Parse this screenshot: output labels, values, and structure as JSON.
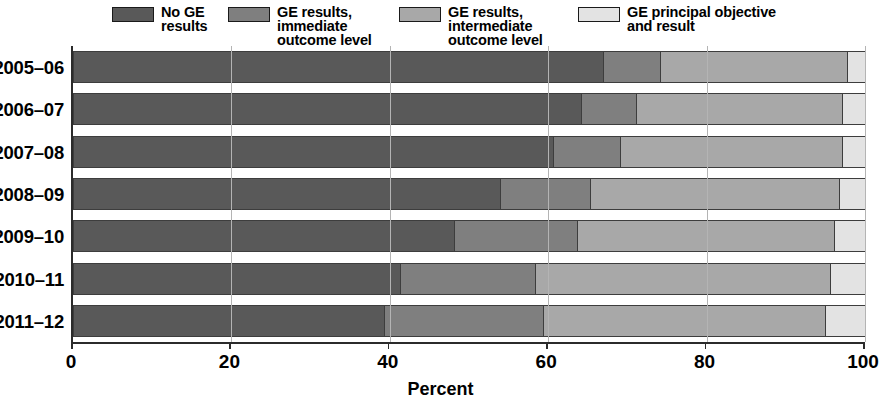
{
  "chart_data": {
    "type": "bar",
    "orientation": "horizontal",
    "stacked": true,
    "stack_mode": "percent",
    "title": "",
    "xlabel": "Percent",
    "ylabel": "",
    "xlim": [
      0,
      100
    ],
    "xticks": [
      0,
      20,
      40,
      60,
      80,
      100
    ],
    "xtick_labels": [
      "0",
      "20",
      "40",
      "60",
      "80",
      "100"
    ],
    "grid": true,
    "grid_axis": "x",
    "legend_position": "top",
    "categories": [
      "2005–06",
      "2006–07",
      "2007–08",
      "2008–09",
      "2009–10",
      "2010–11",
      "2011–12"
    ],
    "series": [
      {
        "name": "No GE\nresults",
        "color": "#595959",
        "values": [
          66.9,
          64.1,
          60.6,
          53.9,
          48.1,
          41.3,
          39.3
        ]
      },
      {
        "name": "GE results, immediate\noutcome level",
        "color": "#7f7f7f",
        "values": [
          7.2,
          7.0,
          8.5,
          11.4,
          15.5,
          17.0,
          20.0
        ]
      },
      {
        "name": "GE results, intermediate\noutcome level",
        "color": "#a8a8a8",
        "values": [
          23.6,
          26.0,
          28.0,
          31.4,
          32.5,
          37.3,
          35.6
        ]
      },
      {
        "name": "GE principal objective\nand result",
        "color": "#e3e3e3",
        "values": [
          2.3,
          2.9,
          2.9,
          3.3,
          3.9,
          4.4,
          5.1
        ]
      }
    ]
  },
  "legend": {
    "items": [
      {
        "label": "No GE\nresults",
        "color": "#595959",
        "swatch": "legend-swatch"
      },
      {
        "label": "GE results, immediate\noutcome level",
        "color": "#7f7f7f",
        "swatch": "legend-swatch"
      },
      {
        "label": "GE results, intermediate\noutcome level",
        "color": "#a8a8a8",
        "swatch": "legend-swatch"
      },
      {
        "label": "GE principal objective\nand result",
        "color": "#e3e3e3",
        "swatch": "legend-swatch"
      }
    ]
  },
  "axis": {
    "x_title": "Percent",
    "x_labels": [
      "0",
      "20",
      "40",
      "60",
      "80",
      "100"
    ],
    "y_labels": [
      "2005–06",
      "2006–07",
      "2007–08",
      "2008–09",
      "2009–10",
      "2010–11",
      "2011–12"
    ]
  },
  "colors": {
    "series_1": "#595959",
    "series_2": "#7f7f7f",
    "series_3": "#a8a8a8",
    "series_4": "#e3e3e3",
    "axis": "#2b2b2b",
    "grid": "#b4b4b4",
    "segment_border": "#3d3d3d",
    "background": "#ffffff"
  }
}
